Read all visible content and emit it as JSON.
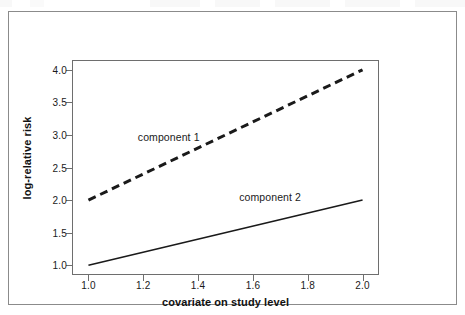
{
  "chart_data": {
    "type": "line",
    "title": "",
    "xlabel": "covariate on study level",
    "ylabel": "log-relative risk",
    "xlim": [
      0.94,
      2.06
    ],
    "ylim": [
      0.85,
      4.15
    ],
    "xticks": [
      "1.0",
      "1.2",
      "1.4",
      "1.6",
      "1.8",
      "2.0"
    ],
    "xtick_values": [
      1.0,
      1.2,
      1.4,
      1.6,
      1.8,
      2.0
    ],
    "yticks": [
      "1.0",
      "1.5",
      "2.0",
      "2.5",
      "3.0",
      "3.5",
      "4.0"
    ],
    "ytick_values": [
      1.0,
      1.5,
      2.0,
      2.5,
      3.0,
      3.5,
      4.0
    ],
    "grid": false,
    "legend_position": "inline-annotation",
    "series": [
      {
        "name": "component 1",
        "style": "dashed",
        "color": "#1a1a1a",
        "linewidth": 3,
        "x": [
          1.0,
          2.0
        ],
        "values": [
          2.0,
          4.0
        ],
        "annotation": "component 1",
        "annotation_x": 1.18,
        "annotation_y": 2.97
      },
      {
        "name": "component 2",
        "style": "solid",
        "color": "#1a1a1a",
        "linewidth": 1.6,
        "x": [
          1.0,
          2.0
        ],
        "values": [
          1.0,
          2.0
        ],
        "annotation": "component 2",
        "annotation_x": 1.55,
        "annotation_y": 2.04
      }
    ]
  },
  "figure": {
    "frame": true,
    "background": "#ffffff",
    "frame_color": "#8b8b8b",
    "axis_color": "#6e6e6e",
    "text_color": "#1a1a1a"
  }
}
